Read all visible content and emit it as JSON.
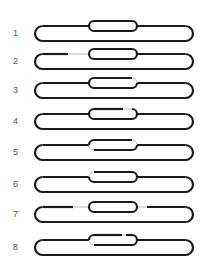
{
  "figure": {
    "type": "loop-diagram-series",
    "colors": {
      "line": "#1a1a1a",
      "gap": "#b8b8b8",
      "label": "#555555"
    },
    "rows": [
      {
        "label": "1",
        "y": 26,
        "variant": "intact"
      },
      {
        "label": "2",
        "y": 54,
        "variant": "outer-left-gap"
      },
      {
        "label": "3",
        "y": 83,
        "variant": "inner-top-right-corner-gap"
      },
      {
        "label": "4",
        "y": 114,
        "variant": "inner-top-gap"
      },
      {
        "label": "5",
        "y": 145,
        "variant": "inner-right-and-lower-left-gap"
      },
      {
        "label": "6",
        "y": 177,
        "variant": "inner-top-left-corner-gap"
      },
      {
        "label": "7",
        "y": 207,
        "variant": "outer-both-gaps"
      },
      {
        "label": "8",
        "y": 240,
        "variant": "inner-split-gap"
      }
    ]
  }
}
